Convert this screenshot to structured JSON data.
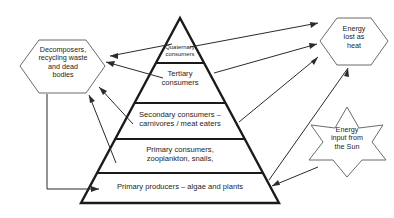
{
  "diagram": {
    "type": "ecological-pyramid",
    "stroke_color": "#1a1a1a",
    "outline_color": "#6b6b6b",
    "background_color": "#ffffff"
  },
  "pyramid": {
    "tiers": [
      {
        "id": "quaternary",
        "label": "Quaternary\nconsumers"
      },
      {
        "id": "tertiary",
        "label": "Tertiary\nconsumers"
      },
      {
        "id": "secondary",
        "label": "Secondary consumers –\ncarnivores / meat eaters"
      },
      {
        "id": "primary-consumers",
        "label": "Primary consumers,\nzooplankton, snails,"
      },
      {
        "id": "primary-producers",
        "label": "Primary producers – algae and plants"
      }
    ]
  },
  "nodes": {
    "decomposers": {
      "label": "Decomposers,\nrecycling waste\nand dead\nbodies",
      "shape": "hexagon"
    },
    "energy_lost": {
      "label": "Energy\nlost as\nheat",
      "shape": "hexagon"
    },
    "energy_input": {
      "label": "Energy\ninput from\nthe Sun",
      "shape": "six-pointed-star"
    }
  },
  "arrows": [
    {
      "id": "quaternary-to-decomposers",
      "from": "quaternary",
      "to": "decomposers"
    },
    {
      "id": "tertiary-to-decomposers",
      "from": "tertiary",
      "to": "decomposers"
    },
    {
      "id": "secondary-to-decomposers",
      "from": "secondary",
      "to": "decomposers"
    },
    {
      "id": "primary-consumers-to-decomposers",
      "from": "primary-consumers",
      "to": "decomposers"
    },
    {
      "id": "decomposers-to-primary-producers",
      "from": "decomposers",
      "to": "primary-producers"
    },
    {
      "id": "quaternary-to-energy-lost",
      "from": "quaternary",
      "to": "energy_lost"
    },
    {
      "id": "tertiary-to-energy-lost",
      "from": "tertiary",
      "to": "energy_lost"
    },
    {
      "id": "secondary-to-energy-lost",
      "from": "secondary",
      "to": "energy_lost"
    },
    {
      "id": "primary-consumers-to-energy-lost",
      "from": "primary-consumers",
      "to": "energy_lost"
    },
    {
      "id": "sun-to-primary-producers",
      "from": "energy_input",
      "to": "primary-producers"
    }
  ]
}
